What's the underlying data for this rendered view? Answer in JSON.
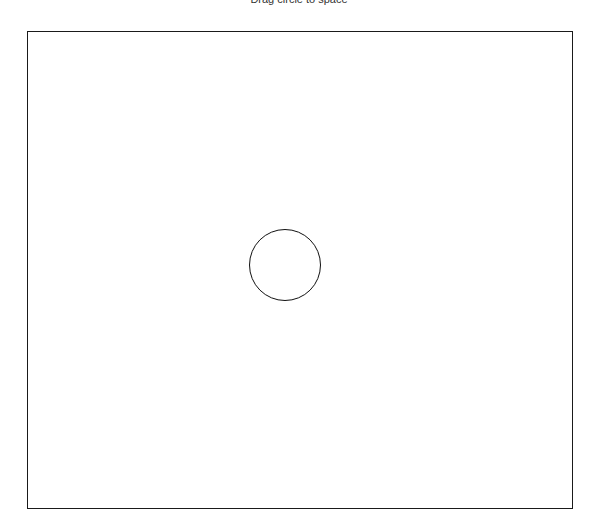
{
  "header": {
    "title": "Drag circle to space"
  },
  "stage": {
    "border_color": "#1a1a1a",
    "background": "#ffffff"
  },
  "circle": {
    "shape": "circle",
    "stroke_color": "#111111",
    "fill": "none"
  }
}
